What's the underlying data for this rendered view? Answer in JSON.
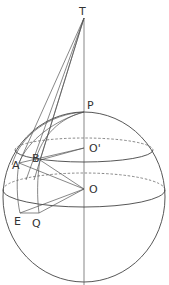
{
  "diagram": {
    "type": "geometric-sphere-construction",
    "labels": {
      "T": "T",
      "P": "P",
      "O_prime": "O'",
      "O": "O",
      "A": "A",
      "B": "B",
      "E": "E",
      "Q": "Q"
    },
    "points": {
      "T": [
        84,
        18
      ],
      "P": [
        84,
        112
      ],
      "O_prime": [
        84,
        148
      ],
      "O": [
        84,
        189
      ],
      "A": [
        19,
        163
      ],
      "B": [
        40,
        160
      ],
      "E": [
        20,
        213
      ],
      "Q": [
        39,
        213
      ]
    },
    "sphere": {
      "cx": 84,
      "cy": 197,
      "r": 83
    },
    "colors": {
      "stroke": "#444444",
      "background": "#ffffff"
    }
  }
}
